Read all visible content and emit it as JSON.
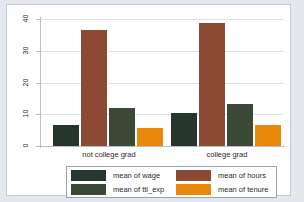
{
  "chart_data": {
    "type": "bar",
    "title": "",
    "subtitle": "",
    "xlabel": "",
    "ylabel": "",
    "categories": [
      "not college grad",
      "college grad"
    ],
    "series": [
      {
        "name": "mean of wage",
        "values": [
          6.6,
          10.3
        ],
        "color": "#27362c"
      },
      {
        "name": "mean of hours",
        "values": [
          36.5,
          38.6
        ],
        "color": "#8c4a34"
      },
      {
        "name": "mean of ttl_exp",
        "values": [
          12.0,
          13.1
        ],
        "color": "#3b4a36"
      },
      {
        "name": "mean of tenure",
        "values": [
          5.6,
          6.5
        ],
        "color": "#e8890c"
      }
    ],
    "ylim": [
      0,
      40
    ],
    "yticks": [
      0,
      10,
      20,
      30,
      40
    ],
    "ytick_labels": [
      "0",
      "10",
      "20",
      "30",
      "40"
    ],
    "grid": true,
    "grid_axis": "y",
    "legend_position": "bottom",
    "legend_columns": 2
  },
  "axis": {
    "y_ticks": [
      {
        "label": "40",
        "value": 40
      },
      {
        "label": "30",
        "value": 30
      },
      {
        "label": "20",
        "value": 20
      },
      {
        "label": "10",
        "value": 10
      },
      {
        "label": "0",
        "value": 0
      }
    ],
    "x_categories": [
      {
        "label": "not college grad"
      },
      {
        "label": "college grad"
      }
    ]
  },
  "legend": {
    "entries": [
      {
        "label": "mean of wage",
        "color": "#27362c"
      },
      {
        "label": "mean of hours",
        "color": "#8c4a34"
      },
      {
        "label": "mean of ttl_exp",
        "color": "#3b4a36"
      },
      {
        "label": "mean of tenure",
        "color": "#e8890c"
      }
    ]
  },
  "theme": {
    "graph_region_color": "#e4e8ee",
    "plot_background": "#ffffff",
    "grid_color": "#dfe3e8",
    "axis_color": "#b9c0c9",
    "text_color": "#2b2b2b"
  }
}
